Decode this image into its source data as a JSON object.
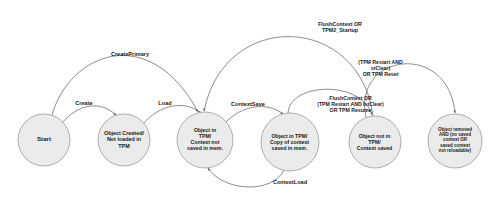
{
  "diagram": {
    "type": "state-diagram",
    "colors": {
      "node_fill": "#ebebeb",
      "node_stroke": "#9a9a9a",
      "edge_stroke": "#6e6e6e",
      "text": "#1a1a1a",
      "background": "#ffffff"
    },
    "nodes": [
      {
        "id": "start",
        "label": "Start",
        "cx": 44,
        "cy": 140,
        "r": 26,
        "font_size": 6.2,
        "label_width": 46
      },
      {
        "id": "object-created",
        "label": "Object Created/\nNot loaded in\nTPM",
        "cx": 124,
        "cy": 140,
        "r": 26,
        "font_size": 5.4,
        "label_width": 50
      },
      {
        "id": "object-in-tpm-no-context",
        "label": "Object in\nTPM/\nContext not\nsaved in mem.",
        "cx": 205,
        "cy": 140,
        "r": 28,
        "font_size": 5.2,
        "label_width": 54
      },
      {
        "id": "object-in-tpm-context-copy",
        "label": "Object in TPM/\nCopy of context\nsaved in mem.",
        "cx": 290,
        "cy": 142,
        "r": 29,
        "font_size": 5.2,
        "label_width": 57
      },
      {
        "id": "object-not-in-tpm-context-saved",
        "label": "Object not in\nTPM/\nContext saved",
        "cx": 375,
        "cy": 142,
        "r": 26,
        "font_size": 5.2,
        "label_width": 51
      },
      {
        "id": "object-removed",
        "label": "Object removed\nAND (no saved\ncontext OR\nsaved context\nnot reloadable)",
        "cx": 455,
        "cy": 141,
        "r": 27,
        "font_size": 4.5,
        "label_width": 52
      }
    ],
    "edges": [
      {
        "id": "create-primary",
        "label": "CreatePrimary",
        "from": "start",
        "to": "object-in-tpm-no-context",
        "label_x": 130,
        "label_y": 54,
        "label_width": 70,
        "font_size": 5.6
      },
      {
        "id": "create",
        "label": "Create",
        "from": "start",
        "to": "object-created",
        "label_x": 84,
        "label_y": 103,
        "label_width": 36,
        "font_size": 5.6
      },
      {
        "id": "load",
        "label": "Load",
        "from": "object-created",
        "to": "object-in-tpm-no-context",
        "label_x": 165,
        "label_y": 103,
        "label_width": 30,
        "font_size": 5.6
      },
      {
        "id": "context-save",
        "label": "ContextSave",
        "from": "object-in-tpm-no-context",
        "to": "object-in-tpm-context-copy",
        "label_x": 248,
        "label_y": 104,
        "label_width": 60,
        "font_size": 5.6
      },
      {
        "id": "context-load",
        "label": "ContextLoad",
        "from": "object-in-tpm-context-copy",
        "to": "object-in-tpm-no-context",
        "label_x": 290,
        "label_y": 182,
        "label_width": 60,
        "font_size": 5.6
      },
      {
        "id": "flush-context-startup",
        "label": "FlushContext OR\nTPM2_Startup",
        "from": "object-not-in-tpm-context-saved",
        "to": "object-in-tpm-no-context",
        "label_x": 340,
        "label_y": 25,
        "label_width": 80,
        "font_size": 5.4
      },
      {
        "id": "tpm-restart-stclear-reset",
        "label": "(TPM Restart AND\nstClear)\nOR TPM Reset",
        "from": "object-not-in-tpm-context-saved",
        "to": "object-removed",
        "label_x": 380,
        "label_y": 64,
        "label_width": 85,
        "font_size": 5.2
      },
      {
        "id": "flush-context-lstclear-resume",
        "label": "FlushContext OR\n(TPM Restart AND lstClear)\nOR TPM Resume",
        "from": "object-in-tpm-context-copy",
        "to": "object-not-in-tpm-context-saved",
        "label_x": 350,
        "label_y": 99,
        "label_width": 115,
        "font_size": 5.2
      }
    ]
  }
}
